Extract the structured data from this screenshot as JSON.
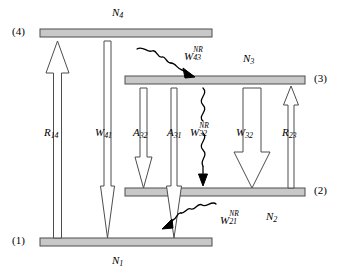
{
  "figure": {
    "type": "energy-level-diagram",
    "background_color": "#ffffff",
    "bar_fill_color": "#c8c8c8",
    "bar_edge_color": "#4d4d4d",
    "arrow_outline_color": "#4d4d4d",
    "squiggle_color": "#000000"
  },
  "levels": [
    {
      "id": "level-4",
      "marker": "(4)",
      "population": "N",
      "population_sub": "4",
      "x": 40,
      "y": 29,
      "width": 172,
      "height": 8,
      "marker_x": 12,
      "marker_y": 27,
      "pop_x": 114,
      "pop_y": 8
    },
    {
      "id": "level-3",
      "marker": "(3)",
      "population": "N",
      "population_sub": "3",
      "x": 125,
      "y": 76,
      "width": 180,
      "height": 8,
      "marker_x": 315,
      "marker_y": 74,
      "pop_x": 245,
      "pop_y": 54
    },
    {
      "id": "level-2",
      "marker": "(2)",
      "population": "N",
      "population_sub": "2",
      "x": 125,
      "y": 188,
      "width": 180,
      "height": 8,
      "marker_x": 315,
      "marker_y": 186,
      "pop_x": 268,
      "pop_y": 212
    },
    {
      "id": "level-1",
      "marker": "(1)",
      "population": "N",
      "population_sub": "1",
      "x": 40,
      "y": 238,
      "width": 172,
      "height": 8,
      "marker_x": 12,
      "marker_y": 236,
      "pop_x": 114,
      "pop_y": 256
    }
  ],
  "transitions": [
    {
      "id": "R14",
      "symbol": "R",
      "sub": "14",
      "sup": "",
      "kind": "hollow-arrow",
      "direction": "up",
      "from_level": "1",
      "to_level": "4",
      "label_x": 44,
      "label_y": 128
    },
    {
      "id": "W41",
      "symbol": "W",
      "sub": "41",
      "sup": "",
      "kind": "hollow-arrow",
      "direction": "down",
      "from_level": "4",
      "to_level": "1",
      "label_x": 95,
      "label_y": 128
    },
    {
      "id": "A32",
      "symbol": "A",
      "sub": "32",
      "sup": "",
      "kind": "hollow-arrow",
      "direction": "down",
      "from_level": "3",
      "to_level": "2",
      "label_x": 134,
      "label_y": 128
    },
    {
      "id": "A31",
      "symbol": "A",
      "sub": "31",
      "sup": "",
      "kind": "hollow-arrow",
      "direction": "down",
      "from_level": "3",
      "to_level": "1",
      "label_x": 168,
      "label_y": 128
    },
    {
      "id": "W32NR",
      "symbol": "W",
      "sub": "32",
      "sup": "NR",
      "kind": "squiggle-arrow",
      "direction": "down",
      "from_level": "3",
      "to_level": "2",
      "label_x": 193,
      "label_y": 126
    },
    {
      "id": "W32",
      "symbol": "W",
      "sub": "32",
      "sup": "",
      "kind": "hollow-arrow",
      "direction": "down",
      "from_level": "3",
      "to_level": "2",
      "label_x": 237,
      "label_y": 128
    },
    {
      "id": "R23",
      "symbol": "R",
      "sub": "23",
      "sup": "",
      "kind": "hollow-arrow",
      "direction": "up",
      "from_level": "2",
      "to_level": "3",
      "label_x": 283,
      "label_y": 128
    },
    {
      "id": "W43NR",
      "symbol": "W",
      "sub": "43",
      "sup": "NR",
      "kind": "squiggle-arrow",
      "direction": "down-right",
      "from_level": "4",
      "to_level": "3",
      "label_x": 185,
      "label_y": 50
    },
    {
      "id": "W21NR",
      "symbol": "W",
      "sub": "21",
      "sup": "NR",
      "kind": "squiggle-arrow",
      "direction": "down-left",
      "from_level": "2",
      "to_level": "1",
      "label_x": 221,
      "label_y": 214
    }
  ]
}
